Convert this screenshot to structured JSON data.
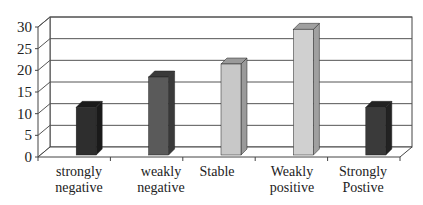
{
  "chart_data": {
    "type": "bar",
    "title": "",
    "xlabel": "",
    "ylabel": "",
    "ylim": [
      0,
      30
    ],
    "yticks": [
      0,
      5,
      10,
      15,
      20,
      25,
      30
    ],
    "grid": true,
    "legend": "none",
    "style": "3d-column",
    "categories": [
      {
        "line1": "strongly",
        "line2": "negative"
      },
      {
        "line1": "weakly",
        "line2": "negative"
      },
      {
        "line1": "Stable",
        "line2": ""
      },
      {
        "line1": "Weakly",
        "line2": "positive"
      },
      {
        "line1": "Strongly",
        "line2": "Postive"
      }
    ],
    "values": [
      11,
      18,
      21,
      29,
      11
    ],
    "colors": [
      "#2e2e2e",
      "#5a5a5a",
      "#c8c8c8",
      "#d0d0d0",
      "#3a3a3a"
    ],
    "side_colors": [
      "#1a1a1a",
      "#3a3a3a",
      "#9a9a9a",
      "#a0a0a0",
      "#222222"
    ]
  }
}
